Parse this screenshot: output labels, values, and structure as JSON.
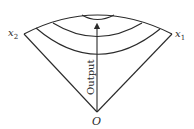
{
  "diagram": {
    "type": "isoquant-cone",
    "labels": {
      "origin": "O",
      "axis_left": "x",
      "axis_left_sub": "2",
      "axis_right": "x",
      "axis_right_sub": "1",
      "arrow": "Output"
    },
    "stroke_color": "#2a2a2a",
    "background": "#ffffff"
  }
}
